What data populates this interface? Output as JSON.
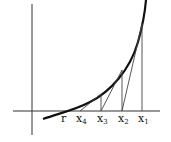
{
  "diagram": {
    "colors": {
      "curve": "#111111",
      "axis": "#333333",
      "lines": "#444444",
      "background": "#ffffff"
    },
    "labels": {
      "root": "r",
      "x4_base": "x",
      "x4_sub": "4",
      "x3_base": "x",
      "x3_sub": "3",
      "x2_base": "x",
      "x2_sub": "2",
      "x1_base": "x",
      "x1_sub": "1"
    },
    "points": {
      "r": [
        69,
        111
      ],
      "x4": [
        80,
        111
      ],
      "x3": [
        101,
        111
      ],
      "x2": [
        122,
        111
      ],
      "x1": [
        142,
        111
      ]
    },
    "curve_points_on": {
      "x1": [
        142,
        24
      ],
      "x2": [
        122,
        70
      ],
      "x3": [
        101,
        94
      ]
    }
  }
}
